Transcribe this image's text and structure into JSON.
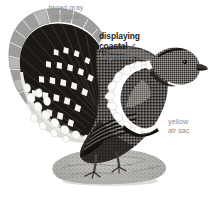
{
  "plate": {
    "width": 212,
    "height": 201,
    "background": "#ffffff",
    "subject": "displaying coastal male grouse",
    "artwork_name": "grouse-illustration"
  },
  "annotations": {
    "tail_band": {
      "text": "broad gray\ntail band",
      "color": "#8d8d8d"
    },
    "air_sac": {
      "text": "yellow\nair sac",
      "color": "#8d8d8d"
    }
  },
  "title": {
    "line1": "displaying",
    "line2": "coastal",
    "sex_symbol": "♂",
    "subspecies": "fuliginosus",
    "color": "#211d1b",
    "subspecies_color": "#8d8d8d"
  },
  "palette": {
    "ink_black": "#141210",
    "feather_black": "#1d1a18",
    "tail_gray": "#9a9a98",
    "tail_gray_light": "#bcbcba",
    "body_gray": "#5d5a57",
    "body_dark": "#2b2826",
    "white": "#ffffff",
    "cream": "#f2f0ea",
    "rock_gray": "#9e9c98",
    "rock_light": "#c9c7c2",
    "air_sac_patch": "#7e7b77"
  }
}
